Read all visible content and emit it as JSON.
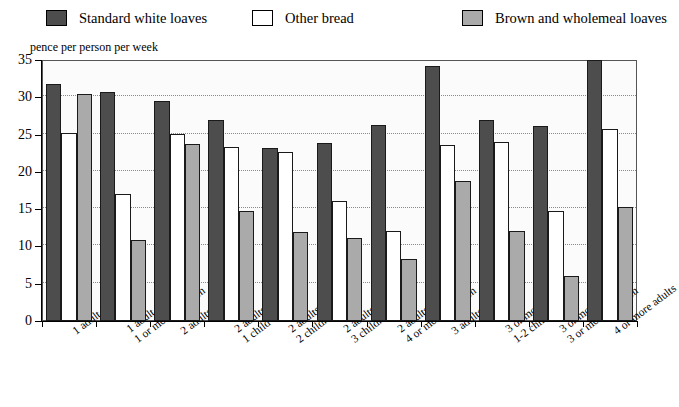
{
  "legend": {
    "items": [
      {
        "label": "Standard white loaves",
        "color": "#4d4d4d",
        "icon": "legend-swatch-icon"
      },
      {
        "label": "Other bread",
        "color": "#ffffff",
        "icon": "legend-swatch-icon"
      },
      {
        "label": "Brown and wholemeal loaves",
        "color": "#aaaaaa",
        "icon": "legend-swatch-icon"
      }
    ]
  },
  "axis_title": "pence per person per week",
  "y_ticks": [
    "0",
    "5",
    "10",
    "15",
    "20",
    "25",
    "30",
    "35"
  ],
  "chart_data": {
    "type": "bar",
    "title": "",
    "subtitle": "",
    "xlabel": "",
    "ylabel": "pence per person per week",
    "ylim": [
      0,
      35
    ],
    "ytick_step": 5,
    "grid": true,
    "legend_position": "top",
    "categories": [
      "1 adult only",
      "1 adult,\n1 or more children",
      "2 adults only",
      "2 adults,\n1 child",
      "2 adults,\n2 children",
      "2 adults,\n3 children",
      "2 adults,\n4 or more children",
      "3 adults only",
      "3 or more adults,\n1-2 children",
      "3 or more adults,\n3 or more children",
      "4 or more adults"
    ],
    "series": [
      {
        "name": "Standard white loaves",
        "color": "#4d4d4d",
        "values": [
          31.8,
          30.7,
          29.5,
          26.9,
          23.2,
          23.9,
          26.3,
          34.2,
          26.9,
          26.1,
          35.0
        ]
      },
      {
        "name": "Other bread",
        "color": "#ffffff",
        "values": [
          25.2,
          17.0,
          25.1,
          23.3,
          22.7,
          16.1,
          12.1,
          23.6,
          24.0,
          14.7,
          25.7
        ]
      },
      {
        "name": "Brown and wholemeal loaves",
        "color": "#aaaaaa",
        "values": [
          30.4,
          10.8,
          23.8,
          14.7,
          11.9,
          11.1,
          8.3,
          18.8,
          12.1,
          6.0,
          15.3
        ]
      }
    ]
  }
}
